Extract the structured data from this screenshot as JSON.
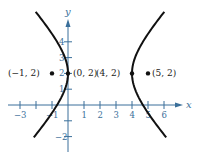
{
  "figure": {
    "type": "hyperbola-graph",
    "axes": {
      "x_label": "x",
      "y_label": "y",
      "x_ticks": [
        "-3",
        "-1",
        "1",
        "2",
        "3",
        "4",
        "5",
        "6"
      ],
      "x_tick_values": [
        -3,
        -2,
        -1,
        1,
        2,
        3,
        4,
        5,
        6
      ],
      "y_ticks": [
        "4",
        "3",
        "2",
        "1",
        "-2"
      ],
      "y_tick_values": [
        4,
        3,
        2,
        1,
        -1,
        -2
      ],
      "axis_color": "#3a6f9a"
    },
    "points": [
      {
        "label": "(−1, 2)",
        "x": -1,
        "y": 2
      },
      {
        "label": "(0, 2)",
        "x": 0,
        "y": 2
      },
      {
        "label": "(4, 2)",
        "x": 4,
        "y": 2
      },
      {
        "label": "(5, 2)",
        "x": 5,
        "y": 2
      }
    ],
    "curve": {
      "equation": "(x-2)^2/4 - (y-2)^2/5 = 1",
      "center": [
        2,
        2
      ],
      "vertices": [
        [
          0,
          2
        ],
        [
          4,
          2
        ]
      ],
      "foci": [
        [
          -1,
          2
        ],
        [
          5,
          2
        ]
      ],
      "color": "#111111"
    }
  }
}
